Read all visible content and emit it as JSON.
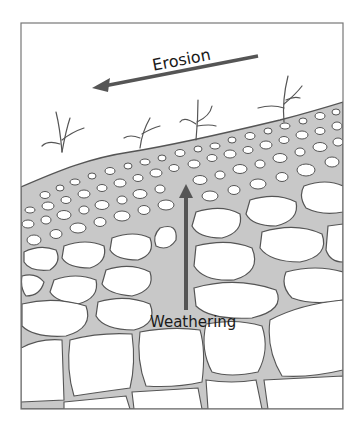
{
  "diagram": {
    "type": "soil-profile-cross-section",
    "labels": {
      "erosion": "Erosion",
      "weathering": "Weathering"
    },
    "arrows": [
      {
        "name": "erosion-arrow",
        "direction": "left",
        "label": "Erosion"
      },
      {
        "name": "weathering-arrow",
        "direction": "up",
        "label": "Weathering"
      }
    ],
    "layers": [
      {
        "name": "surface-with-plants",
        "description": "sloping ground surface with small sprouting plants"
      },
      {
        "name": "topsoil-fine-particles",
        "description": "grey matrix with many small white pebbles"
      },
      {
        "name": "weathered-rock-medium-fragments",
        "description": "grey matrix with medium and large rock fragments"
      },
      {
        "name": "bedrock-blocks",
        "description": "large jointed bedrock blocks with small grey gaps"
      }
    ],
    "colors": {
      "soil_fill": "#c8c8c8",
      "rock_fill": "#ffffff",
      "outline": "#555555",
      "arrow": "#555555",
      "frame": "#777777"
    }
  }
}
